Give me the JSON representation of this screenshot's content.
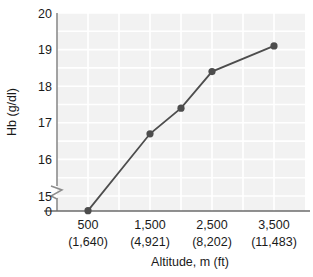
{
  "chart_data": {
    "type": "line",
    "title": "",
    "xlabel": "Altitude, m (ft)",
    "ylabel": "Hb (g/dl)",
    "x": [
      500,
      1500,
      2000,
      2500,
      3500
    ],
    "values": [
      14.6,
      16.7,
      17.4,
      18.4,
      19.1
    ],
    "series": [
      {
        "name": "Hb",
        "x": [
          500,
          1500,
          2000,
          2500,
          3500
        ],
        "values": [
          14.6,
          16.7,
          17.4,
          18.4,
          19.1
        ]
      }
    ],
    "xlim": [
      0,
      4000
    ],
    "ylim": [
      15,
      20
    ],
    "y_axis_break": true,
    "y_break_from": 0,
    "y_break_to": 15,
    "grid": true,
    "legend": "none",
    "x_ticks": [
      {
        "value": 500,
        "label": "500",
        "sublabel": "(1,640)"
      },
      {
        "value": 1500,
        "label": "1,500",
        "sublabel": "(4,921)"
      },
      {
        "value": 2500,
        "label": "2,500",
        "sublabel": "(8,202)"
      },
      {
        "value": 3500,
        "label": "3,500",
        "sublabel": "(11,483)"
      }
    ],
    "y_ticks": [
      {
        "value": 20,
        "label": "20"
      },
      {
        "value": 19,
        "label": "19"
      },
      {
        "value": 18,
        "label": "18"
      },
      {
        "value": 17,
        "label": "17"
      },
      {
        "value": 16,
        "label": "16"
      },
      {
        "value": 15,
        "label": "15"
      },
      {
        "value": 0,
        "label": "0"
      }
    ],
    "colors": {
      "line": "#4d4d4d",
      "marker": "#4d4d4d",
      "plot_background": "#f2f2f2",
      "gridline": "#ffffff",
      "axis": "#808080",
      "text": "#1a1a1a"
    }
  }
}
